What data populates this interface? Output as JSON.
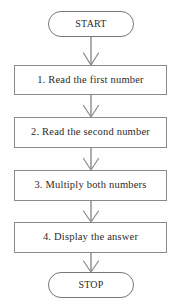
{
  "diagram": {
    "type": "flowchart",
    "orientation": "vertical",
    "colors": {
      "background": "#fefefe",
      "node_fill": "#ffffff",
      "node_stroke": "#8a8a8a",
      "terminator_stroke": "#777777",
      "text": "#2b2b2b",
      "connector": "#8a8a8a"
    },
    "nodes": [
      {
        "id": "start",
        "shape": "terminator",
        "label": "START",
        "x": 48,
        "y": 11,
        "width": 86,
        "height": 26
      },
      {
        "id": "step1",
        "shape": "process",
        "label": "1. Read the first number",
        "x": 14,
        "y": 65,
        "width": 153,
        "height": 30
      },
      {
        "id": "step2",
        "shape": "process",
        "label": "2. Read the second number",
        "x": 14,
        "y": 117,
        "width": 153,
        "height": 31
      },
      {
        "id": "step3",
        "shape": "process",
        "label": "3. Multiply both numbers",
        "x": 14,
        "y": 170,
        "width": 153,
        "height": 31
      },
      {
        "id": "step4",
        "shape": "process",
        "label": "4. Display the answer",
        "x": 14,
        "y": 222,
        "width": 153,
        "height": 31
      },
      {
        "id": "stop",
        "shape": "terminator",
        "label": "STOP",
        "x": 48,
        "y": 272,
        "width": 86,
        "height": 26
      }
    ],
    "connectors": [
      {
        "id": "c1",
        "from": "start",
        "to": "step1",
        "x": 91,
        "y_top": 37,
        "y_bottom": 65,
        "arrow": "open-v"
      },
      {
        "id": "c2",
        "from": "step1",
        "to": "step2",
        "x": 91,
        "y_top": 95,
        "y_bottom": 117,
        "arrow": "open-v"
      },
      {
        "id": "c3",
        "from": "step2",
        "to": "step3",
        "x": 91,
        "y_top": 148,
        "y_bottom": 170,
        "arrow": "open-v"
      },
      {
        "id": "c4",
        "from": "step3",
        "to": "step4",
        "x": 91,
        "y_top": 201,
        "y_bottom": 222,
        "arrow": "open-v"
      },
      {
        "id": "c5",
        "from": "step4",
        "to": "stop",
        "x": 91,
        "y_top": 253,
        "y_bottom": 272,
        "arrow": "open-v"
      }
    ]
  }
}
